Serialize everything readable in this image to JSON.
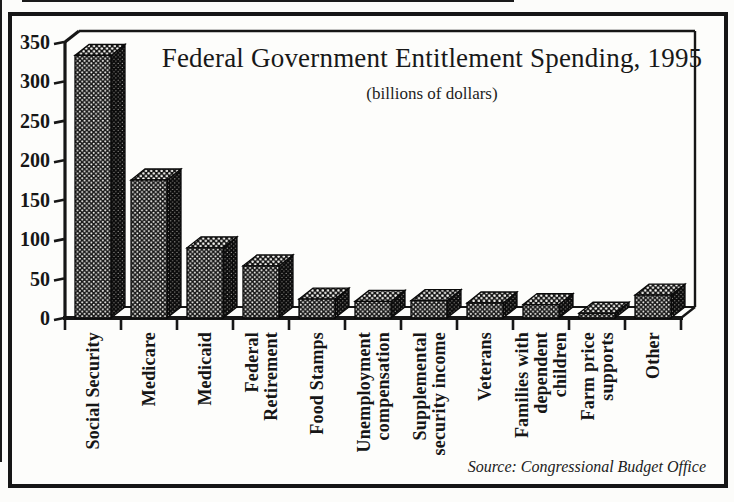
{
  "chart_data": {
    "type": "bar",
    "style": "3d black halftone-dot bars, scanned textbook print, no gridlines, no legend",
    "title": "Federal Government Entitlement Spending, 1995",
    "subtitle": "(billions of dollars)",
    "source": "Source: Congressional Budget Office",
    "unit": "billions of dollars",
    "categories": [
      "Social Security",
      "Medicare",
      "Medicaid",
      "Federal Retirement",
      "Food Stamps",
      "Unemployment compensation",
      "Supplemental security income",
      "Veterans",
      "Families with dependent children",
      "Farm price supports",
      "Other"
    ],
    "category_label_lines": [
      [
        "Social Security"
      ],
      [
        "Medicare"
      ],
      [
        "Medicaid"
      ],
      [
        "Federal",
        "Retirement"
      ],
      [
        "Food Stamps"
      ],
      [
        "Unemployment",
        "compensation"
      ],
      [
        "Supplemental",
        "security income"
      ],
      [
        "Veterans"
      ],
      [
        "Families with",
        "dependent",
        "children"
      ],
      [
        "Farm price",
        "supports"
      ],
      [
        "Other"
      ]
    ],
    "values": [
      333,
      175,
      89,
      66,
      24,
      21,
      22,
      19,
      17,
      6,
      29
    ],
    "ylim": [
      0,
      350
    ],
    "yticks": [
      0,
      50,
      100,
      150,
      200,
      250,
      300,
      350
    ],
    "grid": false,
    "legend": "none",
    "ink_color": "#161616",
    "paper_color": "#fdfdfb"
  }
}
